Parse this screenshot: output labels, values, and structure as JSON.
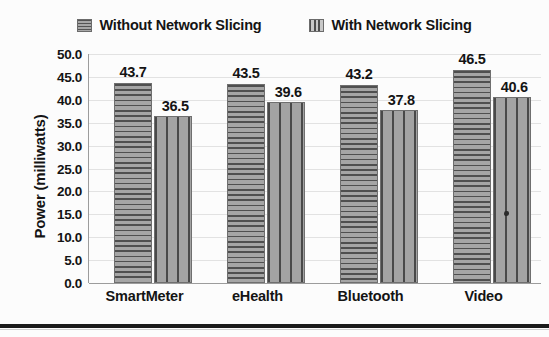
{
  "chart_data": {
    "type": "bar",
    "title": "",
    "subtitle": "",
    "xlabel": "",
    "ylabel": "Power (milliwatts)",
    "categories": [
      "SmartMeter",
      "eHealth",
      "Bluetooth",
      "Video"
    ],
    "series": [
      {
        "name": "Without Network Slicing",
        "pattern": "horizontal-stripes",
        "color": "#8d8d8d",
        "values": [
          43.7,
          43.5,
          43.2,
          46.5
        ],
        "value_labels": [
          "43.7",
          "43.5",
          "43.2",
          "46.5"
        ]
      },
      {
        "name": "With Network Slicing",
        "pattern": "vertical-stripes",
        "color": "#9a9a9a",
        "values": [
          36.5,
          39.6,
          37.8,
          40.6
        ],
        "value_labels": [
          "36.5",
          "39.6",
          "37.8",
          "40.6"
        ]
      }
    ],
    "ylim": [
      0.0,
      50.0
    ],
    "ytick_step": 5.0,
    "ytick_labels": [
      "50.0",
      "45.0",
      "40.0",
      "35.0",
      "30.0",
      "25.0",
      "20.0",
      "15.0",
      "10.0",
      "5.0",
      "0.0"
    ],
    "ytick_values": [
      50.0,
      45.0,
      40.0,
      35.0,
      30.0,
      25.0,
      20.0,
      15.0,
      10.0,
      5.0,
      0.0
    ],
    "grid": true,
    "grid_axis": "y",
    "legend_position": "top-center",
    "legend": [
      "Without Network Slicing",
      "With Network Slicing"
    ]
  },
  "legend": {
    "items": [
      {
        "label": "Without Network Slicing",
        "swatch": "hstripe-swatch-icon"
      },
      {
        "label": "With Network Slicing",
        "swatch": "vstripe-swatch-icon"
      }
    ]
  },
  "axes": {
    "y_title": "Power (milliwatts)"
  }
}
